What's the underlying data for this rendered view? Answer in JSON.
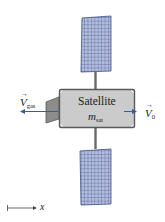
{
  "diagram": {
    "body": {
      "title": "Satellite",
      "mass_symbol": "m",
      "mass_subscript": "sat",
      "fill": "#cbcbcb",
      "stroke": "#5a5a5a"
    },
    "gas_velocity": {
      "symbol": "V",
      "subscript": "gas",
      "arrow_color": "#2f5fa8"
    },
    "satellite_velocity": {
      "symbol": "V",
      "subscript": "0",
      "arrow_color": "#2f5fa8"
    },
    "axis": {
      "label": "x"
    },
    "solar_panel": {
      "fill": "#aab4d6",
      "grid": "#3c4a86"
    }
  }
}
